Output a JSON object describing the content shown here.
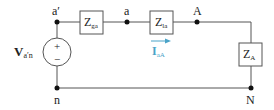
{
  "diagram": {
    "type": "circuit",
    "nodes": {
      "a_prime": "a′",
      "a": "a",
      "A": "A",
      "n": "n",
      "N": "N"
    },
    "components": {
      "Zga": {
        "main": "Z",
        "sub": "ga"
      },
      "Zla": {
        "main": "Z",
        "sub": "la"
      },
      "ZA": {
        "main": "Z",
        "sub": "A"
      },
      "source": {
        "main": "V",
        "sub": "a′n",
        "plus": "+",
        "minus": "−"
      }
    },
    "current": {
      "main": "I",
      "sub": "aA",
      "color": "#4aa3c8"
    }
  }
}
